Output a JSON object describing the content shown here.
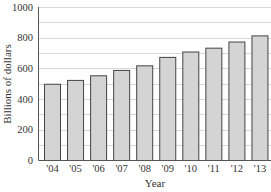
{
  "chart_data": {
    "type": "bar",
    "title": "",
    "xlabel": "Year",
    "ylabel": "Billions of dollars",
    "categories": [
      "'04",
      "'05",
      "'06",
      "'07",
      "'08",
      "'09",
      "'10",
      "'11",
      "'12",
      "'13"
    ],
    "values": [
      500,
      525,
      555,
      590,
      620,
      675,
      710,
      735,
      775,
      815
    ],
    "ylim": [
      0,
      1000
    ],
    "yticks": [
      0,
      200,
      400,
      600,
      800,
      1000
    ],
    "grid": true,
    "grid_step": 100,
    "legend": null,
    "colors": {
      "bar_fill": "#d4d4d4",
      "bar_stroke": "#444444",
      "grid": "#d8d8d8",
      "axis": "#555555"
    }
  }
}
